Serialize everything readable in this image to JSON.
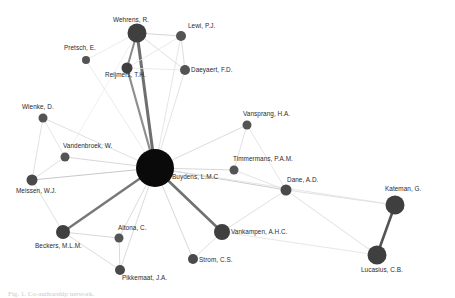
{
  "figure": {
    "caption": "Fig. 1. Co-authorship network.",
    "background_color": "#ffffff"
  },
  "chart_data": {
    "type": "scatter",
    "title": "",
    "subtitle": "",
    "xlabel": "",
    "ylabel": "",
    "grid": false,
    "legend": "none",
    "xlim": [
      0,
      455
    ],
    "ylim": [
      0,
      298
    ],
    "colors": {
      "hub_node": "#0a0a0a",
      "node": "#545454",
      "node_mid": "#4a4a4a",
      "edge_light": "#e3e3e3",
      "edge_medium": "#a9a9a9",
      "edge_dark": "#6f6f6f",
      "label_text": "#2b2b2b",
      "caption_text": "#c9c9c9"
    },
    "nodes": [
      {
        "id": "wehrens",
        "label": "Wehrens, R.",
        "x": 137,
        "y": 33,
        "r": 9.5,
        "color": "#3f3f3f",
        "label_dx": -24,
        "label_dy": -17
      },
      {
        "id": "pretsch",
        "label": "Pretsch, E.",
        "x": 86,
        "y": 60,
        "r": 4.0,
        "color": "#545454",
        "label_dx": -22,
        "label_dy": -16
      },
      {
        "id": "lewi",
        "label": "Lewi, P.J.",
        "x": 181,
        "y": 36,
        "r": 5.0,
        "color": "#545454",
        "label_dx": 7,
        "label_dy": -14
      },
      {
        "id": "reijmers",
        "label": "Reijmers, T.H.",
        "x": 127,
        "y": 68,
        "r": 5.5,
        "color": "#3f3f3f",
        "label_dx": -22,
        "label_dy": 3
      },
      {
        "id": "daeyaert",
        "label": "Daeyaert, F.D.",
        "x": 185,
        "y": 70,
        "r": 5.0,
        "color": "#545454",
        "label_dx": 6,
        "label_dy": -4
      },
      {
        "id": "wienke",
        "label": "Wienke, D.",
        "x": 43,
        "y": 118,
        "r": 4.5,
        "color": "#545454",
        "label_dx": -21,
        "label_dy": -15
      },
      {
        "id": "vandenbroek",
        "label": "Vandenbroek, W.",
        "x": 65,
        "y": 157,
        "r": 4.5,
        "color": "#545454",
        "label_dx": -2,
        "label_dy": -15
      },
      {
        "id": "meissen",
        "label": "Meissen, W.J.",
        "x": 32,
        "y": 180,
        "r": 5.5,
        "color": "#4a4a4a",
        "label_dx": -16,
        "label_dy": 7
      },
      {
        "id": "buydens",
        "label": "Buydens, L.M.C",
        "x": 155,
        "y": 168,
        "r": 19.0,
        "color": "#0a0a0a",
        "label_dx": 17,
        "label_dy": 5
      },
      {
        "id": "vansprang",
        "label": "Vansprang, H.A.",
        "x": 247,
        "y": 125,
        "r": 4.5,
        "color": "#545454",
        "label_dx": -4,
        "label_dy": -15
      },
      {
        "id": "timmermans",
        "label": "Timmermans, P.A.M.",
        "x": 234,
        "y": 170,
        "r": 4.5,
        "color": "#545454",
        "label_dx": -1,
        "label_dy": -15
      },
      {
        "id": "dane",
        "label": "Dane, A.D.",
        "x": 286,
        "y": 190,
        "r": 5.5,
        "color": "#4a4a4a",
        "label_dx": 1,
        "label_dy": -14
      },
      {
        "id": "kateman",
        "label": "Kateman, G.",
        "x": 395,
        "y": 205,
        "r": 9.5,
        "color": "#3f3f3f",
        "label_dx": -10,
        "label_dy": -20
      },
      {
        "id": "lucasius",
        "label": "Lucasius, C.B.",
        "x": 377,
        "y": 255,
        "r": 9.5,
        "color": "#3f3f3f",
        "label_dx": -16,
        "label_dy": 11
      },
      {
        "id": "vankampen",
        "label": "Vankampen, A.H.C.",
        "x": 222,
        "y": 232,
        "r": 8.0,
        "color": "#3f3f3f",
        "label_dx": 9,
        "label_dy": -4
      },
      {
        "id": "strom",
        "label": "Strom, C.S.",
        "x": 193,
        "y": 259,
        "r": 5.0,
        "color": "#4a4a4a",
        "label_dx": 6,
        "label_dy": -3
      },
      {
        "id": "altona",
        "label": "Altona, C.",
        "x": 119,
        "y": 238,
        "r": 4.5,
        "color": "#545454",
        "label_dx": -1,
        "label_dy": -14
      },
      {
        "id": "beckers",
        "label": "Beckers, M.L.M.",
        "x": 63,
        "y": 232,
        "r": 7.0,
        "color": "#3f3f3f",
        "label_dx": -28,
        "label_dy": 10
      },
      {
        "id": "pikkemaat",
        "label": "Pikkemaat, J.A.",
        "x": 120,
        "y": 270,
        "r": 5.0,
        "color": "#4a4a4a",
        "label_dx": 2,
        "label_dy": 4
      }
    ],
    "edges": [
      {
        "source": "wehrens",
        "target": "buydens",
        "weight": 3.0,
        "color": "#6f6f6f"
      },
      {
        "source": "wehrens",
        "target": "reijmers",
        "weight": 2.0,
        "color": "#8a8a8a"
      },
      {
        "source": "wehrens",
        "target": "lewi",
        "weight": 1.0,
        "color": "#d6d6d6"
      },
      {
        "source": "wehrens",
        "target": "daeyaert",
        "weight": 1.0,
        "color": "#e0e0e0"
      },
      {
        "source": "wehrens",
        "target": "pretsch",
        "weight": 0.8,
        "color": "#e6e6e6"
      },
      {
        "source": "wehrens",
        "target": "vandenbroek",
        "weight": 0.8,
        "color": "#ececec"
      },
      {
        "source": "lewi",
        "target": "reijmers",
        "weight": 0.8,
        "color": "#e2e2e2"
      },
      {
        "source": "lewi",
        "target": "daeyaert",
        "weight": 1.0,
        "color": "#dddddd"
      },
      {
        "source": "lewi",
        "target": "buydens",
        "weight": 0.9,
        "color": "#e2e2e2"
      },
      {
        "source": "daeyaert",
        "target": "reijmers",
        "weight": 0.8,
        "color": "#e4e4e4"
      },
      {
        "source": "daeyaert",
        "target": "buydens",
        "weight": 0.9,
        "color": "#e0e0e0"
      },
      {
        "source": "reijmers",
        "target": "buydens",
        "weight": 2.2,
        "color": "#8f8f8f"
      },
      {
        "source": "pretsch",
        "target": "buydens",
        "weight": 0.8,
        "color": "#e6e6e6"
      },
      {
        "source": "wienke",
        "target": "buydens",
        "weight": 0.9,
        "color": "#dedede"
      },
      {
        "source": "wienke",
        "target": "meissen",
        "weight": 0.9,
        "color": "#dedede"
      },
      {
        "source": "wienke",
        "target": "vandenbroek",
        "weight": 0.9,
        "color": "#e2e2e2"
      },
      {
        "source": "vandenbroek",
        "target": "buydens",
        "weight": 1.0,
        "color": "#d8d8d8"
      },
      {
        "source": "vandenbroek",
        "target": "meissen",
        "weight": 0.9,
        "color": "#dcdcdc"
      },
      {
        "source": "meissen",
        "target": "buydens",
        "weight": 1.1,
        "color": "#c9c9c9"
      },
      {
        "source": "meissen",
        "target": "beckers",
        "weight": 0.9,
        "color": "#dedede"
      },
      {
        "source": "beckers",
        "target": "buydens",
        "weight": 2.4,
        "color": "#777777"
      },
      {
        "source": "beckers",
        "target": "altona",
        "weight": 1.0,
        "color": "#d9d9d9"
      },
      {
        "source": "beckers",
        "target": "pikkemaat",
        "weight": 1.0,
        "color": "#dcdcdc"
      },
      {
        "source": "altona",
        "target": "buydens",
        "weight": 1.0,
        "color": "#dbdbdb"
      },
      {
        "source": "altona",
        "target": "pikkemaat",
        "weight": 1.0,
        "color": "#d9d9d9"
      },
      {
        "source": "pikkemaat",
        "target": "buydens",
        "weight": 1.0,
        "color": "#dcdcdc"
      },
      {
        "source": "strom",
        "target": "buydens",
        "weight": 1.0,
        "color": "#d8d8d8"
      },
      {
        "source": "strom",
        "target": "vankampen",
        "weight": 0.9,
        "color": "#dedede"
      },
      {
        "source": "vankampen",
        "target": "buydens",
        "weight": 2.6,
        "color": "#717171"
      },
      {
        "source": "vankampen",
        "target": "dane",
        "weight": 0.9,
        "color": "#dcdcdc"
      },
      {
        "source": "timmermans",
        "target": "buydens",
        "weight": 1.0,
        "color": "#d8d8d8"
      },
      {
        "source": "timmermans",
        "target": "vansprang",
        "weight": 0.9,
        "color": "#dedede"
      },
      {
        "source": "timmermans",
        "target": "dane",
        "weight": 0.9,
        "color": "#e0e0e0"
      },
      {
        "source": "vansprang",
        "target": "buydens",
        "weight": 1.0,
        "color": "#dcdcdc"
      },
      {
        "source": "vansprang",
        "target": "dane",
        "weight": 0.9,
        "color": "#e2e2e2"
      },
      {
        "source": "dane",
        "target": "buydens",
        "weight": 1.2,
        "color": "#cfcfcf"
      },
      {
        "source": "dane",
        "target": "kateman",
        "weight": 0.9,
        "color": "#dedede"
      },
      {
        "source": "dane",
        "target": "lucasius",
        "weight": 0.9,
        "color": "#dcdcdc"
      },
      {
        "source": "kateman",
        "target": "lucasius",
        "weight": 2.6,
        "color": "#555555"
      },
      {
        "source": "kateman",
        "target": "buydens",
        "weight": 0.9,
        "color": "#e2e2e2"
      },
      {
        "source": "lucasius",
        "target": "vankampen",
        "weight": 0.9,
        "color": "#e4e4e4"
      }
    ]
  }
}
